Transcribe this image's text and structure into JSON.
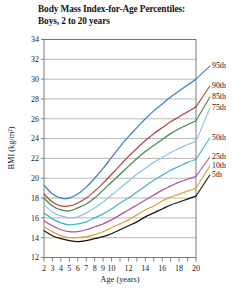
{
  "chart_data": {
    "type": "line",
    "title": "Body Mass Index-for-Age Percentiles:",
    "subtitle": "Boys, 2 to 20 years",
    "xlabel": "Age (years)",
    "ylabel": "BMI (kg/m²)",
    "xlim": [
      2,
      20
    ],
    "ylim": [
      12,
      34
    ],
    "grid": "horizontal",
    "legend_position": "right",
    "xticks": [
      2,
      3,
      4,
      5,
      6,
      7,
      8,
      9,
      10,
      11,
      12,
      13,
      14,
      15,
      16,
      17,
      18,
      19,
      20
    ],
    "xtick_labels": [
      "2",
      "3",
      "4",
      "5",
      "6",
      "7",
      "8",
      "9",
      "10",
      "",
      "12",
      "",
      "14",
      "",
      "16",
      "",
      "18",
      "",
      "20"
    ],
    "yticks": [
      12,
      14,
      16,
      18,
      20,
      22,
      24,
      26,
      28,
      30,
      32,
      34
    ],
    "ytick_labels": [
      "12",
      "14",
      "16",
      "18",
      "20",
      "22",
      "24",
      "26",
      "28",
      "30",
      "32",
      "34"
    ],
    "x": [
      2,
      3,
      4,
      5,
      6,
      7,
      8,
      9,
      10,
      11,
      12,
      13,
      14,
      15,
      16,
      17,
      18,
      19,
      20
    ],
    "series": [
      {
        "name": "95th",
        "label": "95th",
        "color": "#3f7fc4",
        "legend_y": 68,
        "values": [
          19.3,
          18.4,
          18.0,
          18.0,
          18.4,
          19.1,
          20.0,
          21.0,
          22.1,
          23.2,
          24.2,
          25.1,
          26.0,
          26.8,
          27.5,
          28.2,
          28.8,
          29.4,
          30.0
        ]
      },
      {
        "name": "90th",
        "label": "90th",
        "color": "#b4483f",
        "legend_y": 88,
        "values": [
          18.4,
          17.6,
          17.2,
          17.2,
          17.5,
          18.0,
          18.7,
          19.5,
          20.4,
          21.3,
          22.2,
          23.0,
          23.8,
          24.5,
          25.1,
          25.7,
          26.2,
          26.7,
          27.2
        ]
      },
      {
        "name": "85th",
        "label": "85th",
        "color": "#3f8a4c",
        "legend_y": 99,
        "values": [
          18.0,
          17.2,
          16.8,
          16.7,
          17.0,
          17.4,
          18.0,
          18.8,
          19.6,
          20.4,
          21.2,
          22.0,
          22.7,
          23.3,
          23.9,
          24.5,
          25.0,
          25.4,
          25.8
        ]
      },
      {
        "name": "75th",
        "label": "75th",
        "color": "#8fc4e0",
        "legend_y": 110,
        "values": [
          17.3,
          16.6,
          16.2,
          16.0,
          16.1,
          16.5,
          17.0,
          17.6,
          18.3,
          19.0,
          19.7,
          20.4,
          21.0,
          21.6,
          22.1,
          22.6,
          23.0,
          23.4,
          23.7
        ]
      },
      {
        "name": "50th",
        "label": "50th",
        "color": "#3fb7c4",
        "legend_y": 140,
        "values": [
          16.5,
          15.9,
          15.5,
          15.3,
          15.4,
          15.6,
          16.0,
          16.4,
          16.9,
          17.5,
          18.0,
          18.6,
          19.2,
          19.8,
          20.3,
          20.8,
          21.2,
          21.6,
          21.9
        ]
      },
      {
        "name": "25th",
        "label": "25th",
        "color": "#b0539b",
        "legend_y": 159,
        "values": [
          15.7,
          15.2,
          14.8,
          14.6,
          14.6,
          14.8,
          15.1,
          15.4,
          15.8,
          16.3,
          16.8,
          17.3,
          17.8,
          18.3,
          18.8,
          19.2,
          19.6,
          19.9,
          20.2
        ]
      },
      {
        "name": "10th",
        "label": "10th",
        "color": "#e0a13a",
        "legend_y": 168,
        "values": [
          15.1,
          14.6,
          14.2,
          14.0,
          14.0,
          14.1,
          14.3,
          14.6,
          15.0,
          15.4,
          15.8,
          16.3,
          16.8,
          17.2,
          17.7,
          18.1,
          18.4,
          18.7,
          19.0
        ]
      },
      {
        "name": "5th",
        "label": "5th",
        "color": "#151515",
        "legend_y": 177,
        "values": [
          14.7,
          14.2,
          13.9,
          13.7,
          13.6,
          13.7,
          13.9,
          14.1,
          14.4,
          14.8,
          15.2,
          15.6,
          16.1,
          16.5,
          16.9,
          17.3,
          17.6,
          17.9,
          18.2
        ]
      }
    ]
  }
}
